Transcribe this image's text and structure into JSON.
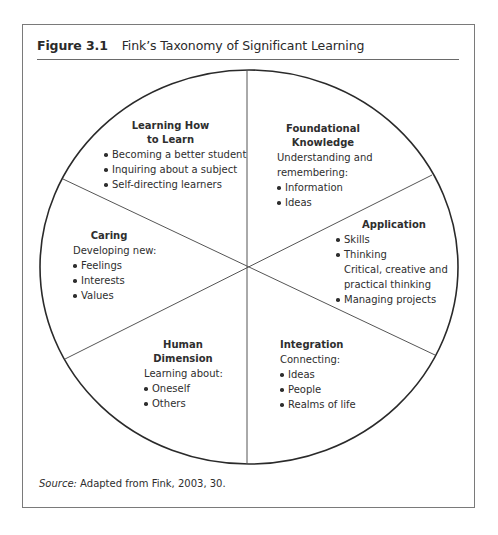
{
  "figure": {
    "label": "Figure 3.1",
    "title": "Fink’s Taxonomy of Significant Learning",
    "source_label": "Source:",
    "source_text": " Adapted from Fink, 2003, 30."
  },
  "diagram": {
    "type": "circle-divided-into-six-segments",
    "colors": {
      "text": "#2e2e2e",
      "circle_stroke": "#2a2a2a",
      "divider_stroke": "#555555",
      "frame_border": "#7a7a7a"
    },
    "segments": [
      {
        "id": "learning-how-to-learn",
        "position": "top-left",
        "heading_line1": "Learning How",
        "heading_line2": "to Learn",
        "description": "",
        "items": [
          "Becoming a better student",
          "Inquiring about a subject",
          "Self-directing learners"
        ]
      },
      {
        "id": "foundational-knowledge",
        "position": "top-right",
        "heading_line1": "Foundational",
        "heading_line2": "Knowledge",
        "description_line1": "Understanding and",
        "description_line2": "remembering:",
        "items": [
          "Information",
          "Ideas"
        ]
      },
      {
        "id": "application",
        "position": "right",
        "heading_line1": "Application",
        "items": [
          "Skills",
          "Thinking"
        ],
        "sub_lines": [
          "Critical, creative and",
          "practical thinking"
        ],
        "items_after": [
          "Managing projects"
        ]
      },
      {
        "id": "integration",
        "position": "bottom-right",
        "heading_line1": "Integration",
        "description": "Connecting:",
        "items": [
          "Ideas",
          "People",
          "Realms of life"
        ]
      },
      {
        "id": "human-dimension",
        "position": "bottom-left",
        "heading_line1": "Human",
        "heading_line2": "Dimension",
        "description": "Learning about:",
        "items": [
          "Oneself",
          "Others"
        ]
      },
      {
        "id": "caring",
        "position": "left",
        "heading_line1": "Caring",
        "description": "Developing new:",
        "items": [
          "Feelings",
          "Interests",
          "Values"
        ]
      }
    ]
  }
}
